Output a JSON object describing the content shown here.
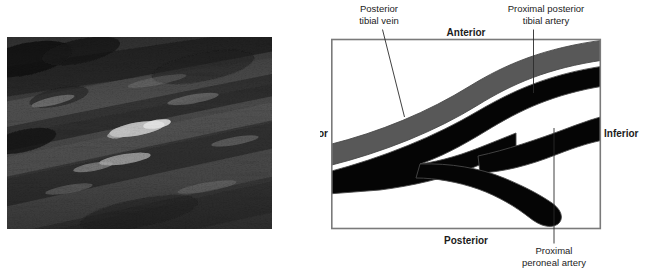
{
  "figure": {
    "panels": [
      {
        "id": "ultrasound",
        "kind": "grayscale-ultrasound-image"
      },
      {
        "id": "schematic",
        "kind": "anatomical-line-diagram"
      }
    ]
  },
  "ultrasound": {
    "alt_name": "longitudinal grayscale ultrasound of calf vessels",
    "background_color": "#2a2a2a"
  },
  "diagram": {
    "orientation": {
      "anterior": "Anterior",
      "posterior": "Posterior",
      "superior": "Superior",
      "inferior": "Inferior"
    },
    "annotations": [
      {
        "id": "posterior-tibial-vein",
        "line1": "Posterior",
        "line2": "tibial vein"
      },
      {
        "id": "proximal-posterior-tibial-artery",
        "line1": "Proximal posterior",
        "line2": "tibial artery"
      },
      {
        "id": "proximal-peroneal-artery",
        "line1": "Proximal",
        "line2": "peroneal artery"
      }
    ],
    "colors": {
      "vein_fill": "#585858",
      "artery_fill": "#050505",
      "vessel_outline": "#4a4a4a",
      "box_border": "#7a7a7a",
      "background": "#ffffff",
      "text": "#1b1b1b"
    }
  }
}
